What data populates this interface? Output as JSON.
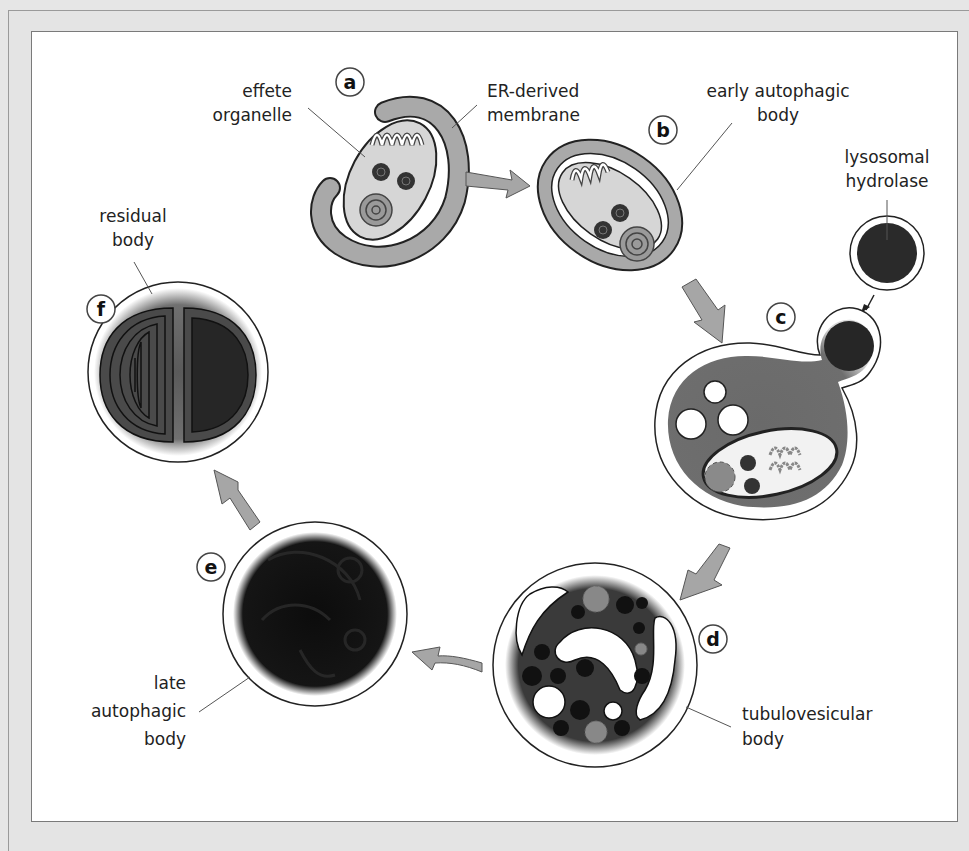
{
  "figure": {
    "stages": [
      {
        "id": "a",
        "badge": "a",
        "label_lines": [
          "ER-derived",
          "membrane"
        ],
        "extra_label_lines": [
          "effete",
          "organelle"
        ]
      },
      {
        "id": "b",
        "badge": "b",
        "label_lines": [
          "early autophagic",
          "body"
        ]
      },
      {
        "id": "c",
        "badge": "c",
        "label_lines": [
          "lysosomal",
          "hydrolase"
        ]
      },
      {
        "id": "d",
        "badge": "d",
        "label_lines": [
          "tubulovesicular",
          "body"
        ]
      },
      {
        "id": "e",
        "badge": "e",
        "label_lines": [
          "late",
          "autophagic",
          "body"
        ]
      },
      {
        "id": "f",
        "badge": "f",
        "label_lines": [
          "residual",
          "body"
        ]
      }
    ],
    "flow": [
      "a",
      "b",
      "c",
      "d",
      "e",
      "f"
    ],
    "colors": {
      "membrane_gray": "#a9a9a9",
      "organelle_fill": "#d8d8d8",
      "dark_fill": "#1e1e1e",
      "arrow_fill": "#a6a6a6",
      "outline": "#222222",
      "frame_bg": "#e4e4e4",
      "panel_bg": "#ffffff"
    }
  }
}
